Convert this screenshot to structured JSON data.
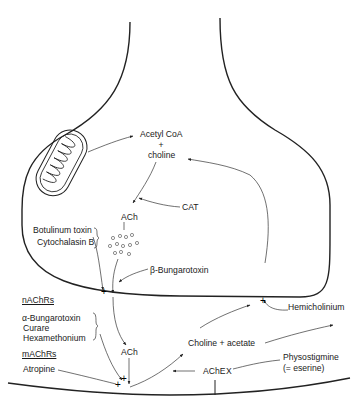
{
  "diagram": {
    "presynaptic": {
      "precursors": {
        "acetyl_coa": "Acetyl CoA",
        "plus": "+",
        "choline": "choline"
      },
      "enzyme": "CAT",
      "product": "ACh",
      "release_blockers": [
        "Botulinum toxin",
        "Cytochalasin B"
      ],
      "presynaptic_toxin": "β-Bungarotoxin"
    },
    "cleft": {
      "ach": "ACh",
      "breakdown": "Choline + acetate",
      "enzyme": "AChE",
      "enzyme_block_mark": "X",
      "reuptake_blocker": "Hemicholinium",
      "ache_inhibitor": {
        "name": "Physostigmine",
        "alias": "(= eserine)"
      }
    },
    "receptors": {
      "nicotinic": {
        "heading": "nAChRs",
        "antagonists": [
          "α-Bungarotoxin",
          "Curare",
          "Hexamethonium"
        ]
      },
      "muscarinic": {
        "heading": "mAChRs",
        "antagonists": [
          "Atropine"
        ]
      }
    }
  }
}
